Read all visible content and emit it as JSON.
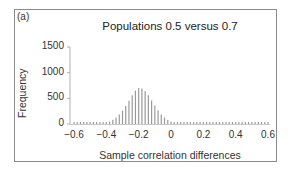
{
  "figure": {
    "panel_label": "(a)"
  },
  "chart_data": {
    "type": "bar",
    "title": "Populations 0.5 versus 0.7",
    "xlabel": "Sample correlation differences",
    "ylabel": "Frequency",
    "xlim": [
      -0.6,
      0.6
    ],
    "ylim": [
      0,
      1500
    ],
    "xticks": [
      "-0.6",
      "-0.4",
      "-0.2",
      "0",
      "0.2",
      "0.4",
      "0.6"
    ],
    "xtick_values": [
      -0.6,
      -0.4,
      -0.2,
      0,
      0.2,
      0.4,
      0.6
    ],
    "yticks": [
      "1500",
      "1000",
      "500",
      "0"
    ],
    "ytick_values": [
      1500,
      1000,
      500,
      0
    ],
    "grid": false,
    "legend": null,
    "bar_color": "#9a9a9a",
    "x": [
      -0.6,
      -0.58,
      -0.56,
      -0.54,
      -0.52,
      -0.5,
      -0.48,
      -0.46,
      -0.44,
      -0.42,
      -0.4,
      -0.38,
      -0.36,
      -0.34,
      -0.32,
      -0.3,
      -0.28,
      -0.26,
      -0.24,
      -0.22,
      -0.2,
      -0.18,
      -0.16,
      -0.14,
      -0.12,
      -0.1,
      -0.08,
      -0.06,
      -0.04,
      -0.02,
      0.0,
      0.02,
      0.04,
      0.06,
      0.08,
      0.1,
      0.12,
      0.14,
      0.16,
      0.18,
      0.2,
      0.22,
      0.24,
      0.26,
      0.28,
      0.3,
      0.32,
      0.34,
      0.36,
      0.38,
      0.4,
      0.42,
      0.44,
      0.46,
      0.48,
      0.5,
      0.52,
      0.54,
      0.56,
      0.58,
      0.6
    ],
    "values": [
      0,
      0,
      0,
      0,
      0,
      1,
      2,
      4,
      8,
      15,
      28,
      48,
      80,
      125,
      185,
      260,
      350,
      450,
      560,
      650,
      700,
      690,
      640,
      560,
      460,
      360,
      265,
      185,
      125,
      80,
      48,
      28,
      15,
      8,
      4,
      2,
      1,
      0,
      0,
      0,
      0,
      0,
      0,
      0,
      0,
      0,
      0,
      0,
      0,
      0,
      0,
      0,
      0,
      0,
      0,
      0,
      0,
      0,
      0,
      0,
      0
    ]
  }
}
